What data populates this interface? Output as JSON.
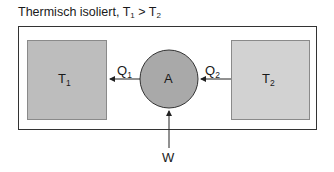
{
  "title": {
    "text": "Thermisch isoliert, T",
    "sub1": "1",
    "mid": " > T",
    "sub2": "2"
  },
  "reservoirs": [
    {
      "label": "T",
      "sub": "1",
      "fill": "#bdbdbd"
    },
    {
      "label": "T",
      "sub": "2",
      "fill": "#d2d2d2"
    }
  ],
  "engine": {
    "label": "A",
    "fill": "#a9a9a9"
  },
  "flows": [
    {
      "label": "Q",
      "sub": "1"
    },
    {
      "label": "Q",
      "sub": "2"
    },
    {
      "label": "W"
    }
  ]
}
